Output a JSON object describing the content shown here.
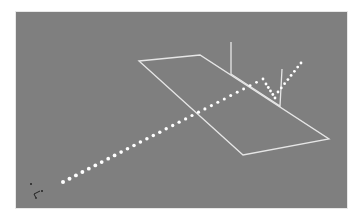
{
  "viewport": {
    "background_color": "#7f7f7f",
    "frame_color": "#ffffff",
    "trajectory_color": "#ffffff",
    "plane_color": "#e6e6e6"
  },
  "scene": {
    "ground_plane": {
      "corners": [
        [
          139,
          61
        ],
        [
          200,
          55
        ],
        [
          329,
          139
        ],
        [
          243,
          155
        ]
      ]
    },
    "vertical_panel": {
      "corners": [
        [
          231,
          42
        ],
        [
          231,
          74
        ],
        [
          280,
          106
        ],
        [
          282,
          69
        ]
      ]
    },
    "trajectory": {
      "incoming": {
        "start": [
          63,
          182
        ],
        "end": [
          263,
          79
        ],
        "dot_count": 32
      },
      "bounce_down": {
        "start": [
          266,
          84
        ],
        "end": [
          275,
          98
        ],
        "dot_count": 5
      },
      "rebound": {
        "start": [
          278,
          92
        ],
        "end": [
          301,
          63
        ],
        "dot_count": 8
      }
    },
    "axis_gizmo": {
      "position": [
        34,
        194
      ],
      "icon": "axis-gizmo-icon"
    }
  }
}
